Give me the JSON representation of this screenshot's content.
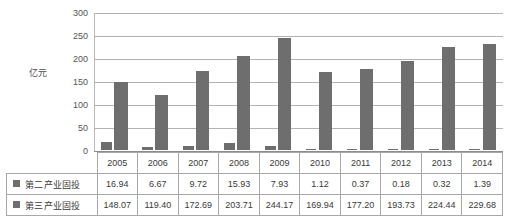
{
  "chart_data": {
    "type": "bar",
    "title": "",
    "xlabel": "",
    "ylabel": "亿元",
    "ylim": [
      0,
      300
    ],
    "ytick_step": 50,
    "yticks": [
      "300",
      "250",
      "200",
      "150",
      "100",
      "50",
      "0"
    ],
    "grid": true,
    "legend_position": "table-row-labels",
    "categories": [
      "2005",
      "2006",
      "2007",
      "2008",
      "2009",
      "2010",
      "2011",
      "2012",
      "2013",
      "2014"
    ],
    "series": [
      {
        "name": "第二产业固投",
        "values": [
          16.94,
          6.67,
          9.72,
          15.93,
          7.93,
          1.12,
          0.37,
          0.18,
          0.32,
          1.39
        ],
        "value_labels": [
          "16.94",
          "6.67",
          "9.72",
          "15.93",
          "7.93",
          "1.12",
          "0.37",
          "0.18",
          "0.32",
          "1.39"
        ],
        "color": "#6e6e6e"
      },
      {
        "name": "第三产业固投",
        "values": [
          148.07,
          119.4,
          172.69,
          203.71,
          244.17,
          169.94,
          177.2,
          193.73,
          224.44,
          229.68
        ],
        "value_labels": [
          "148.07",
          "119.40",
          "172.69",
          "203.71",
          "244.17",
          "169.94",
          "177.20",
          "193.73",
          "224.44",
          "229.68"
        ],
        "color": "#6e6e6e"
      }
    ]
  },
  "colors": {
    "bar": "#6e6e6e",
    "gridline": "#b3b3b3",
    "table_border": "#a8a8a8",
    "text": "#3a3a3a"
  }
}
